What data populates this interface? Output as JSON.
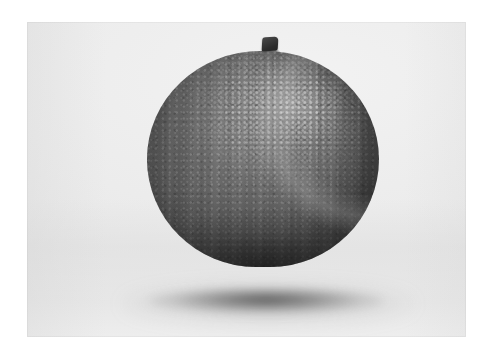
{
  "page": {
    "background_color": "#ffffff",
    "width": 494,
    "height": 358
  },
  "photograph": {
    "caption": "Orange",
    "alt_text": "A single whole orange with a short dark stem, photographed on a plain light gray studio background, casting a soft shadow.",
    "rendering": "grayscale",
    "frame": {
      "left": 27,
      "top": 22,
      "width": 439,
      "height": 315,
      "border_color": "#ffffff"
    },
    "backdrop": {
      "name": "studio-backdrop",
      "top_color": "#f0f0f0",
      "mid_color": "#ededed",
      "floor_color": "#e4e4e4"
    },
    "subject": {
      "name": "orange-fruit",
      "label": "orange",
      "shape": "sphere",
      "center_x": 263,
      "center_y": 190,
      "width": 232,
      "height": 216,
      "surface": "pebbled citrus peel",
      "highlight_color": "#a0a0a0",
      "midtone_color": "#5e5e5e",
      "shadow_color": "#323232",
      "light_direction": "upper right"
    },
    "stem": {
      "name": "fruit-stem",
      "label": "stem",
      "color": "#2b2b2b",
      "width": 16,
      "height": 14
    },
    "cast_shadow": {
      "name": "contact-shadow",
      "label": "shadow",
      "color": "#282828",
      "opacity": 0.7,
      "width": 236,
      "height": 26
    }
  }
}
